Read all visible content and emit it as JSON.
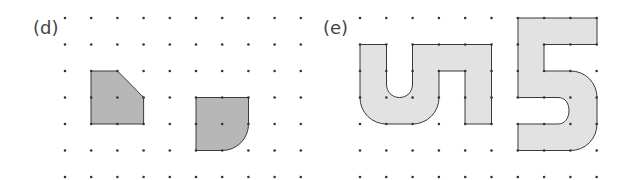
{
  "panels": [
    {
      "id": "d",
      "label": "(d)",
      "label_pos": [
        33,
        34
      ],
      "grid": {
        "x0": 65,
        "dx": 26.2,
        "cols": 10,
        "y0": 18,
        "dy": 26.5,
        "rows": 7
      },
      "fill": "#b7b7b7",
      "shapes": [
        {
          "name": "pentagon-cut-corner",
          "path": "M91,71 L117.5,71 L143.6,97.5 L143.6,124 L91,124 Z"
        },
        {
          "name": "square-with-quarter-arc",
          "path": "M196,97.5 L248.5,97.5 L248.5,124 A26.3,26.3 0 0 1 222,150.5 L196,150.5 Z"
        }
      ]
    },
    {
      "id": "e",
      "label": "(e)",
      "label_pos": [
        323,
        34
      ],
      "grid": {
        "x0": 360,
        "dx": 26.3,
        "cols": 10,
        "y0": 18,
        "dy": 26.5,
        "rows": 7
      },
      "fill": "#e2e2e2",
      "shapes": [
        {
          "name": "letter-u-n-shape",
          "path": "M360,44.5 L386.5,44.5 L386.5,84 C386.5,92 392,97.5 399.5,97.5 C407,97.5 412.5,92 412.5,84 L412.5,44.5 L491.5,44.5 L491.5,124 L465,124 L465,71 L439,71 L439,97.5 A26.3,26.3 0 0 1 412.5,124 L386.5,124 A26.3,26.3 0 0 1 360,97.5 Z"
        },
        {
          "name": "digit-five-shape",
          "path": "M518,18 L597,18 L597,44.5 L544,44.5 L544,71 L570.5,71 A26.3,26.3 0 0 1 597,97.5 L597,124 A26.3,26.3 0 0 1 570.5,150.5 L518,150.5 L518,124 L558,124 C565,124 569,118 569,110.5 C569,103 565,97.5 558,97.5 L518,97.5 Z"
        }
      ]
    }
  ],
  "colors": {
    "dot": "#333333",
    "stroke": "#3a3a3a",
    "label": "#444444"
  }
}
